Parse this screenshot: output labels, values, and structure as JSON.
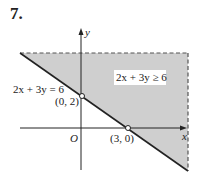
{
  "problem_number": "7.",
  "graph": {
    "axis_x_label": "x",
    "axis_y_label": "y",
    "origin_label": "O",
    "boundary_equation": "2x + 3y = 6",
    "region_label": "2x + 3y ≥ 6",
    "points": [
      {
        "label": "(0, 2)",
        "x": 0,
        "y": 2
      },
      {
        "label": "(3, 0)",
        "x": 3,
        "y": 0
      }
    ],
    "colors": {
      "shade": "#cfcfcf",
      "line": "#222222",
      "dash": "#555555"
    }
  }
}
